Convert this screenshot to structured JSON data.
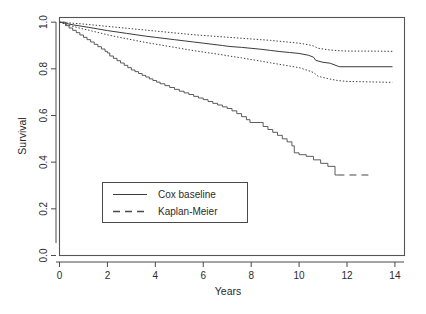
{
  "chart_data": {
    "type": "line",
    "title": "",
    "xlabel": "Years",
    "ylabel": "Survival",
    "xlim": [
      0,
      14.4
    ],
    "ylim": [
      0.0,
      1.02
    ],
    "xticks": [
      0,
      2,
      4,
      6,
      8,
      10,
      12,
      14
    ],
    "xticklabels": [
      "0",
      "2",
      "4",
      "6",
      "8",
      "10",
      "12",
      "14"
    ],
    "yticks": [
      0.0,
      0.2,
      0.4,
      0.6,
      0.8,
      1.0
    ],
    "yticklabels": [
      "0.0",
      "0.2",
      "0.4",
      "0.6",
      "0.8",
      "1.0"
    ],
    "grid": false,
    "legend_position": "center-left-lower",
    "series": [
      {
        "name": "Cox baseline",
        "style": "solid",
        "x": [
          0.0,
          0.3,
          0.6,
          0.9,
          1.2,
          1.6,
          2.0,
          2.4,
          2.8,
          3.2,
          3.6,
          4.0,
          4.4,
          4.8,
          5.2,
          5.6,
          6.0,
          6.4,
          6.8,
          7.0,
          7.2,
          7.6,
          8.0,
          8.4,
          8.8,
          9.2,
          9.6,
          10.0,
          10.4,
          10.6,
          10.7,
          11.0,
          11.3,
          11.6,
          11.7,
          12.0,
          13.0,
          13.9
        ],
        "y": [
          1.0,
          0.994,
          0.988,
          0.983,
          0.978,
          0.971,
          0.964,
          0.958,
          0.952,
          0.946,
          0.94,
          0.935,
          0.93,
          0.925,
          0.92,
          0.915,
          0.91,
          0.905,
          0.9,
          0.897,
          0.895,
          0.892,
          0.888,
          0.884,
          0.879,
          0.874,
          0.87,
          0.866,
          0.858,
          0.85,
          0.836,
          0.828,
          0.824,
          0.812,
          0.809,
          0.809,
          0.809,
          0.809
        ]
      },
      {
        "name": "Upper confidence band",
        "style": "dotted",
        "x": [
          0.0,
          0.3,
          0.6,
          0.9,
          1.2,
          1.6,
          2.0,
          2.4,
          2.8,
          3.2,
          3.6,
          4.0,
          4.4,
          4.8,
          5.2,
          5.6,
          6.0,
          6.4,
          6.8,
          7.2,
          7.6,
          8.0,
          8.4,
          8.8,
          9.2,
          9.6,
          10.0,
          10.4,
          10.6,
          10.8,
          11.2,
          11.6,
          12.0,
          13.0,
          13.9
        ],
        "y": [
          1.0,
          0.998,
          0.995,
          0.993,
          0.99,
          0.986,
          0.982,
          0.978,
          0.974,
          0.97,
          0.966,
          0.962,
          0.958,
          0.954,
          0.95,
          0.946,
          0.943,
          0.94,
          0.937,
          0.934,
          0.931,
          0.928,
          0.925,
          0.922,
          0.918,
          0.914,
          0.91,
          0.903,
          0.898,
          0.888,
          0.882,
          0.878,
          0.876,
          0.876,
          0.875
        ]
      },
      {
        "name": "Lower confidence band",
        "style": "dotted",
        "x": [
          0.0,
          0.3,
          0.6,
          0.9,
          1.2,
          1.6,
          2.0,
          2.4,
          2.8,
          3.2,
          3.6,
          4.0,
          4.4,
          4.8,
          5.2,
          5.6,
          6.0,
          6.4,
          6.8,
          7.2,
          7.6,
          8.0,
          8.4,
          8.8,
          9.2,
          9.6,
          10.0,
          10.4,
          10.6,
          10.8,
          11.2,
          11.6,
          12.0,
          13.0,
          13.9
        ],
        "y": [
          1.0,
          0.99,
          0.981,
          0.973,
          0.966,
          0.956,
          0.946,
          0.937,
          0.929,
          0.921,
          0.913,
          0.906,
          0.899,
          0.892,
          0.885,
          0.878,
          0.872,
          0.866,
          0.86,
          0.853,
          0.847,
          0.84,
          0.833,
          0.826,
          0.819,
          0.812,
          0.805,
          0.792,
          0.784,
          0.768,
          0.758,
          0.75,
          0.746,
          0.744,
          0.742
        ]
      },
      {
        "name": "Kaplan-Meier",
        "style": "step-solid-then-dashed",
        "x": [
          0.0,
          0.25,
          0.4,
          0.55,
          0.7,
          0.85,
          1.0,
          1.15,
          1.3,
          1.45,
          1.6,
          1.75,
          1.9,
          2.0,
          2.1,
          2.25,
          2.4,
          2.55,
          2.7,
          2.85,
          3.0,
          3.15,
          3.3,
          3.45,
          3.6,
          3.75,
          3.9,
          4.05,
          4.2,
          4.4,
          4.6,
          4.8,
          5.0,
          5.2,
          5.4,
          5.6,
          5.8,
          6.0,
          6.2,
          6.4,
          6.6,
          6.8,
          7.0,
          7.2,
          7.4,
          7.6,
          7.8,
          7.95,
          8.4,
          8.5,
          8.7,
          8.9,
          9.1,
          9.3,
          9.5,
          9.7,
          9.8,
          10.0,
          10.3,
          10.6,
          10.9,
          11.2,
          11.5,
          11.6,
          13.0
        ],
        "y": [
          1.0,
          0.985,
          0.975,
          0.965,
          0.955,
          0.945,
          0.935,
          0.925,
          0.915,
          0.905,
          0.895,
          0.885,
          0.875,
          0.868,
          0.855,
          0.845,
          0.835,
          0.825,
          0.815,
          0.805,
          0.795,
          0.788,
          0.78,
          0.772,
          0.765,
          0.757,
          0.75,
          0.743,
          0.736,
          0.728,
          0.72,
          0.712,
          0.704,
          0.697,
          0.69,
          0.682,
          0.675,
          0.668,
          0.66,
          0.652,
          0.645,
          0.637,
          0.63,
          0.62,
          0.608,
          0.595,
          0.582,
          0.57,
          0.57,
          0.553,
          0.54,
          0.528,
          0.515,
          0.5,
          0.487,
          0.47,
          0.44,
          0.432,
          0.425,
          0.41,
          0.395,
          0.382,
          0.345,
          0.345,
          0.345
        ],
        "dash_start_x": 11.6
      }
    ],
    "legend": [
      {
        "label": "Cox baseline",
        "style": "solid"
      },
      {
        "label": "Kaplan-Meier",
        "style": "dashed"
      }
    ],
    "colors": {
      "line": "#3a3a3a",
      "axis": "#4a4a4a",
      "text": "#2b2b2b",
      "background": "#ffffff"
    }
  }
}
